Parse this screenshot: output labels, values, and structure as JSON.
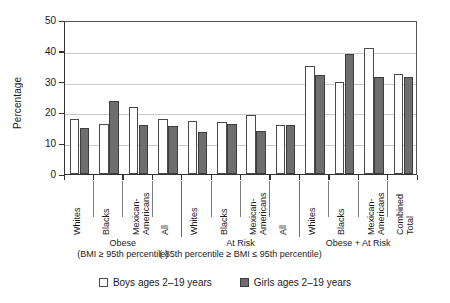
{
  "chart_data": {
    "type": "bar",
    "title": "",
    "xlabel": "",
    "ylabel": "Percentage",
    "ylim": [
      0,
      50
    ],
    "yticks": [
      0,
      10,
      20,
      30,
      40,
      50
    ],
    "grid": true,
    "legend_position": "bottom",
    "categories": [
      "Whites",
      "Blacks",
      "Mexican-\nAmericans",
      "All",
      "Whites",
      "Blacks",
      "Mexican-\nAmericans",
      "All",
      "Whites",
      "Blacks",
      "Mexican-\nAmericans",
      "Combined\nTotal"
    ],
    "groups": [
      {
        "title": "Obese",
        "subtitle": "(BMI ≥ 95th percentile)",
        "count": 4
      },
      {
        "title": "At Risk",
        "subtitle": "( 85th percentile ≥ BMI ≤ 95th percentile)",
        "count": 4
      },
      {
        "title": "Obese + At Risk",
        "subtitle": "",
        "count": 4
      }
    ],
    "series": [
      {
        "name": "Boys ages 2–19 years",
        "color": "#ffffff",
        "values": [
          17.8,
          16.2,
          21.8,
          17.8,
          17.2,
          16.8,
          19.0,
          15.8,
          35.0,
          30.0,
          41.0,
          32.5
        ]
      },
      {
        "name": "Girls ages 2–19 years",
        "color": "#6e6e6e",
        "values": [
          14.8,
          23.6,
          16.0,
          15.5,
          13.5,
          16.2,
          14.0,
          15.8,
          32.2,
          39.0,
          31.5,
          31.5
        ]
      }
    ]
  },
  "legend": {
    "items": [
      {
        "label": "Boys ages 2–19 years"
      },
      {
        "label": "Girls ages 2–19 years"
      }
    ]
  }
}
